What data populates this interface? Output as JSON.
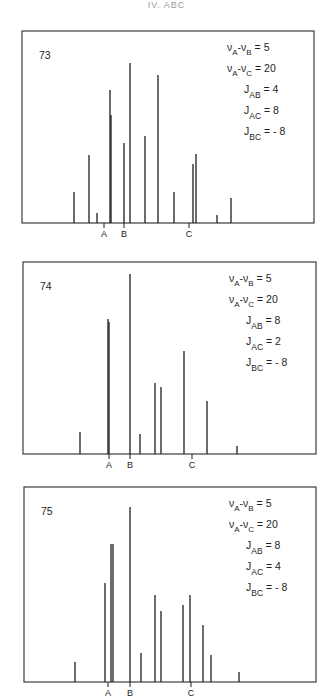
{
  "header": {
    "running_title": "IV. ABC"
  },
  "chart_data": [
    {
      "type": "stick-spectrum",
      "title": "73",
      "parameters": [
        {
          "label": "νA-νB",
          "value": "5"
        },
        {
          "label": "νA-νC",
          "value": "20"
        },
        {
          "label": "JAB",
          "value": "4"
        },
        {
          "label": "JAC",
          "value": "8"
        },
        {
          "label": "JBC",
          "value": "-8"
        }
      ],
      "axis_markers": [
        {
          "label": "A",
          "x": 104
        },
        {
          "label": "B",
          "x": 124
        },
        {
          "label": "C",
          "x": 189
        }
      ],
      "box": {
        "x1": 22,
        "y1": 31,
        "x2": 314,
        "y2": 223
      },
      "lines": [
        {
          "x": 74,
          "top": 192
        },
        {
          "x": 89,
          "top": 155
        },
        {
          "x": 97,
          "top": 213
        },
        {
          "x": 110,
          "top": 90
        },
        {
          "x": 111,
          "top": 115
        },
        {
          "x": 124,
          "top": 143
        },
        {
          "x": 130,
          "top": 63
        },
        {
          "x": 145,
          "top": 136
        },
        {
          "x": 158,
          "top": 75
        },
        {
          "x": 174,
          "top": 192
        },
        {
          "x": 193,
          "top": 164
        },
        {
          "x": 196,
          "top": 154
        },
        {
          "x": 217,
          "top": 215
        },
        {
          "x": 231,
          "top": 198
        }
      ]
    },
    {
      "type": "stick-spectrum",
      "title": "74",
      "parameters": [
        {
          "label": "νA-νB",
          "value": "5"
        },
        {
          "label": "νA-νC",
          "value": "20"
        },
        {
          "label": "JAB",
          "value": "8"
        },
        {
          "label": "JAC",
          "value": "2"
        },
        {
          "label": "JBC",
          "value": "-8"
        }
      ],
      "axis_markers": [
        {
          "label": "A",
          "x": 109
        },
        {
          "label": "B",
          "x": 130
        },
        {
          "label": "C",
          "x": 192
        }
      ],
      "box": {
        "x1": 23,
        "y1": 262,
        "x2": 316,
        "y2": 454
      },
      "lines": [
        {
          "x": 80,
          "top": 432
        },
        {
          "x": 108,
          "top": 319
        },
        {
          "x": 109,
          "top": 322
        },
        {
          "x": 130,
          "top": 274
        },
        {
          "x": 140,
          "top": 434
        },
        {
          "x": 155,
          "top": 383
        },
        {
          "x": 161,
          "top": 387
        },
        {
          "x": 184,
          "top": 351
        },
        {
          "x": 207,
          "top": 401
        },
        {
          "x": 237,
          "top": 446
        }
      ]
    },
    {
      "type": "stick-spectrum",
      "title": "75",
      "parameters": [
        {
          "label": "νA-νB",
          "value": "5"
        },
        {
          "label": "νA-νC",
          "value": "20"
        },
        {
          "label": "JAB",
          "value": "8"
        },
        {
          "label": "JAC",
          "value": "4"
        },
        {
          "label": "JBC",
          "value": "-8"
        }
      ],
      "axis_markers": [
        {
          "label": "A",
          "x": 108
        },
        {
          "label": "B",
          "x": 130
        },
        {
          "label": "C",
          "x": 191
        }
      ],
      "box": {
        "x1": 24,
        "y1": 487,
        "x2": 316,
        "y2": 682
      },
      "lines": [
        {
          "x": 75,
          "top": 662
        },
        {
          "x": 105,
          "top": 583
        },
        {
          "x": 111,
          "top": 544
        },
        {
          "x": 113,
          "top": 544
        },
        {
          "x": 130,
          "top": 507
        },
        {
          "x": 141,
          "top": 653
        },
        {
          "x": 155,
          "top": 595
        },
        {
          "x": 161,
          "top": 611
        },
        {
          "x": 183,
          "top": 605
        },
        {
          "x": 190,
          "top": 595
        },
        {
          "x": 203,
          "top": 625
        },
        {
          "x": 211,
          "top": 655
        },
        {
          "x": 239,
          "top": 672
        }
      ]
    }
  ]
}
